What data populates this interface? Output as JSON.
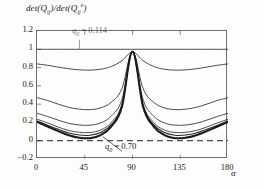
{
  "figure": {
    "y_axis_title_parts": {
      "det1": "det(Q",
      "sub1": "ij",
      "mid": ")/det(Q",
      "sub2": "ij",
      "sup": "e",
      "close": ")"
    },
    "y_axis_title": "det(Qij)/det(Qij e)",
    "x_axis_title": "α",
    "annotation_top_prefix": "q",
    "annotation_top_sub": "0",
    "annotation_top_value": "= 0.114",
    "annotation_bottom_prefix": "q",
    "annotation_bottom_sub": "0",
    "annotation_bottom_value": "= 0.70",
    "zero_line_label": "0"
  },
  "chart_data": {
    "type": "line",
    "title": "",
    "xlabel": "α",
    "ylabel": "det(Qij)/det(Qij^e)",
    "xlim": [
      0,
      180
    ],
    "ylim": [
      -0.2,
      1.2
    ],
    "xticks": [
      "0",
      "45",
      "90",
      "135",
      "180"
    ],
    "xtick_values": [
      0,
      45,
      90,
      135,
      180
    ],
    "yticks": [
      "1.2",
      "1",
      "0.8",
      "0.6",
      "0.4",
      "0.2",
      "0",
      "−0.2"
    ],
    "ytick_values": [
      1.2,
      1,
      0.8,
      0.6,
      0.4,
      0.2,
      0,
      -0.2
    ],
    "grid": false,
    "legend": "none",
    "reference_lines": [
      {
        "name": "zero-dashed-line",
        "y": 0,
        "style": "dashed"
      }
    ],
    "x": [
      0,
      10,
      20,
      30,
      40,
      50,
      60,
      70,
      80,
      90,
      100,
      110,
      120,
      130,
      140,
      150,
      160,
      170,
      180
    ],
    "series": [
      {
        "name": "q0 = 0.00",
        "q0": 0.0,
        "values": [
          1.0,
          1.0,
          1.0,
          1.0,
          1.0,
          1.0,
          1.0,
          1.0,
          1.0,
          1.0,
          1.0,
          1.0,
          1.0,
          1.0,
          1.0,
          1.0,
          1.0,
          1.0,
          1.0
        ]
      },
      {
        "name": "q0 = 0.114",
        "q0": 0.114,
        "values": [
          0.84,
          0.825,
          0.805,
          0.787,
          0.775,
          0.772,
          0.782,
          0.812,
          0.875,
          0.97,
          0.875,
          0.812,
          0.782,
          0.772,
          0.775,
          0.787,
          0.805,
          0.825,
          0.84
        ]
      },
      {
        "name": "q0 = 0.35",
        "q0": 0.35,
        "values": [
          0.47,
          0.44,
          0.4,
          0.365,
          0.345,
          0.34,
          0.36,
          0.42,
          0.57,
          0.97,
          0.57,
          0.42,
          0.36,
          0.34,
          0.345,
          0.365,
          0.4,
          0.44,
          0.47
        ]
      },
      {
        "name": "q0 = 0.50",
        "q0": 0.5,
        "values": [
          0.3,
          0.265,
          0.225,
          0.19,
          0.172,
          0.17,
          0.195,
          0.27,
          0.45,
          0.97,
          0.45,
          0.27,
          0.195,
          0.17,
          0.172,
          0.19,
          0.225,
          0.265,
          0.3
        ]
      },
      {
        "name": "q0 = 0.60",
        "q0": 0.6,
        "values": [
          0.235,
          0.195,
          0.15,
          0.112,
          0.092,
          0.09,
          0.118,
          0.2,
          0.4,
          0.97,
          0.4,
          0.2,
          0.118,
          0.09,
          0.092,
          0.112,
          0.15,
          0.195,
          0.235
        ]
      },
      {
        "name": "q0 = 0.65",
        "q0": 0.65,
        "values": [
          0.215,
          0.17,
          0.125,
          0.085,
          0.062,
          0.06,
          0.09,
          0.175,
          0.382,
          0.97,
          0.382,
          0.175,
          0.09,
          0.06,
          0.062,
          0.085,
          0.125,
          0.17,
          0.215
        ]
      },
      {
        "name": "q0 = 0.70",
        "q0": 0.7,
        "values": [
          0.205,
          0.155,
          0.105,
          0.06,
          0.032,
          0.028,
          0.062,
          0.155,
          0.37,
          0.975,
          0.37,
          0.155,
          0.062,
          0.028,
          0.032,
          0.06,
          0.105,
          0.155,
          0.205
        ]
      }
    ],
    "series_styles": [
      {
        "width": 0.9,
        "color": "#3a3a3a"
      },
      {
        "width": 0.9,
        "color": "#3a3a3a"
      },
      {
        "width": 0.9,
        "color": "#3a3a3a"
      },
      {
        "width": 0.9,
        "color": "#3a3a3a"
      },
      {
        "width": 0.9,
        "color": "#3a3a3a"
      },
      {
        "width": 1.1,
        "color": "#2a2a2a"
      },
      {
        "width": 2.0,
        "color": "#1a1a1a"
      }
    ]
  }
}
